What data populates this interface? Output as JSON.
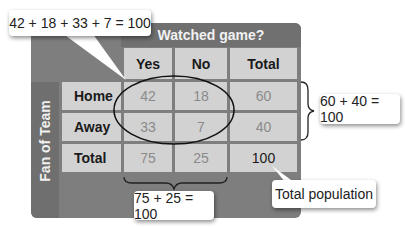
{
  "table": {
    "column_group_title": "Watched game?",
    "row_group_title": "Fan of Team",
    "column_headers": [
      "Yes",
      "No",
      "Total"
    ],
    "rows": [
      {
        "label": "Home",
        "values": [
          "42",
          "18",
          "60"
        ]
      },
      {
        "label": "Away",
        "values": [
          "33",
          "7",
          "40"
        ]
      },
      {
        "label": "Total",
        "values": [
          "75",
          "25",
          "100"
        ]
      }
    ]
  },
  "callouts": {
    "joint_sum": "42 + 18 + 33 + 7 = 100",
    "row_totals_sum": "60 + 40 = 100",
    "column_totals_sum": "75 + 25 = 100",
    "total_population": "Total population"
  },
  "colors": {
    "frame": "#7e7e7e",
    "cell": "#d2d2d2",
    "header_text": "#f2f2f2"
  }
}
